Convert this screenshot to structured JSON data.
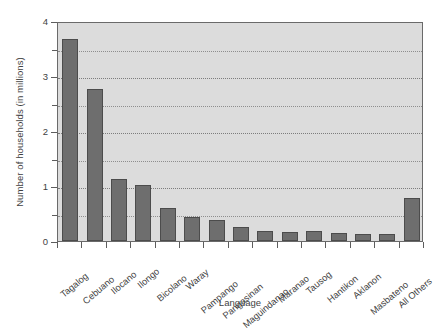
{
  "chart_data": {
    "type": "bar",
    "title": "",
    "xlabel": "Language",
    "ylabel": "Number of households (in millions)",
    "categories": [
      "Tagalog",
      "Cebuano",
      "Ilocano",
      "Ilongo",
      "Bicolano",
      "Waray",
      "Pampango",
      "Pangasinan",
      "Maguindanao",
      "Maranao",
      "Tausog",
      "Hantikon",
      "Aklanon",
      "Masbateno",
      "All Others"
    ],
    "values": [
      3.68,
      2.77,
      1.12,
      1.02,
      0.6,
      0.44,
      0.39,
      0.25,
      0.19,
      0.17,
      0.18,
      0.15,
      0.12,
      0.12,
      0.78
    ],
    "ylim": [
      0,
      4
    ],
    "yticks": [
      0,
      1,
      2,
      3,
      4
    ],
    "ytick_labels": [
      "0",
      "1",
      "2",
      "3",
      "4"
    ],
    "yminor_ticks": [
      0.5,
      1.5,
      2.5,
      3.5
    ],
    "gridlines": [
      0.5,
      1.0,
      1.5,
      2.0,
      2.5,
      3.0,
      3.5
    ],
    "grid": true,
    "legend": "none",
    "bar_color": "#6e6e6e",
    "bar_edge_color": "#4c4c4c",
    "plot_background": "#dcdcdc",
    "axis_color": "#6a6a6a",
    "figure_background": "#ffffff"
  }
}
